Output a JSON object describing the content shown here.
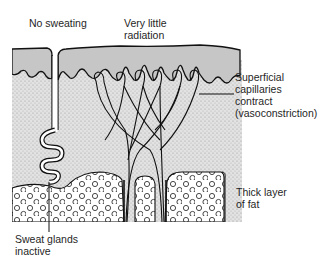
{
  "figure": {
    "colors": {
      "epidermis": "#c4c4c4",
      "dermis": "#dcdcdc",
      "fat_bg": "#ffffff",
      "outline": "#111111"
    }
  },
  "labels": {
    "no_sweating": "No sweating",
    "very_little_radiation": [
      "Very little",
      "radiation"
    ],
    "superficial_capillaries": [
      "Superficial",
      "capillaries",
      "contract",
      "(vasoconstriction)"
    ],
    "thick_fat": [
      "Thick layer",
      "of fat"
    ],
    "sweat_glands": [
      "Sweat glands",
      "inactive"
    ]
  },
  "layers": [
    {
      "name": "epidermis",
      "description": "outer skin layer (shaded grey)"
    },
    {
      "name": "dermis",
      "description": "stippled middle layer containing capillary loops and sweat gland"
    },
    {
      "name": "subcutaneous-fat",
      "description": "thick layer of fat cells (circles)"
    }
  ]
}
